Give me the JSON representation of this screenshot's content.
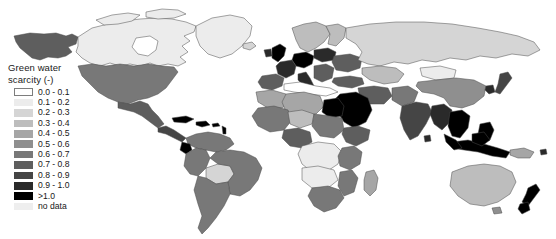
{
  "figure": {
    "type": "choropleth-world-map",
    "background": "#ffffff",
    "ocean_color": "#ffffff",
    "border_color": "#4a4a4a"
  },
  "legend": {
    "title_line1": "Green water",
    "title_line2": "scarcity (-)",
    "entries": [
      {
        "label": "0.0 - 0.1",
        "color": "#ffffff"
      },
      {
        "label": "0.1 - 0.2",
        "color": "#ececec"
      },
      {
        "label": "0.2 - 0.3",
        "color": "#d5d5d5"
      },
      {
        "label": "0.3 - 0.4",
        "color": "#bdbdbd"
      },
      {
        "label": "0.4 - 0.5",
        "color": "#a6a6a6"
      },
      {
        "label": "0.5 - 0.6",
        "color": "#8f8f8f"
      },
      {
        "label": "0.6 - 0.7",
        "color": "#787878"
      },
      {
        "label": "0.7 - 0.8",
        "color": "#5e5e5e"
      },
      {
        "label": "0.8 - 0.9",
        "color": "#454545"
      },
      {
        "label": "0.9 - 1.0",
        "color": "#2a2a2a"
      },
      {
        "label": ">1.0",
        "color": "#000000"
      },
      {
        "label": "no data",
        "color": "#eeeeee"
      }
    ]
  },
  "chart_data": {
    "type": "heatmap",
    "title": "Green water scarcity (-)",
    "xlabel": "",
    "ylabel": "",
    "colorscale": "grayscale-light-to-dark",
    "bins": [
      "0.0 - 0.1",
      "0.1 - 0.2",
      "0.2 - 0.3",
      "0.3 - 0.4",
      "0.4 - 0.5",
      "0.5 - 0.6",
      "0.6 - 0.7",
      "0.7 - 0.8",
      "0.8 - 0.9",
      "0.9 - 1.0",
      ">1.0",
      "no data"
    ],
    "bin_colors": [
      "#ffffff",
      "#ececec",
      "#d5d5d5",
      "#bdbdbd",
      "#a6a6a6",
      "#8f8f8f",
      "#787878",
      "#5e5e5e",
      "#454545",
      "#2a2a2a",
      "#000000",
      "#eeeeee"
    ],
    "regions": [
      {
        "name": "Alaska",
        "bin": "0.7 - 0.8",
        "color": "#5e5e5e"
      },
      {
        "name": "Canada",
        "bin": "0.1 - 0.2",
        "color": "#ececec"
      },
      {
        "name": "Greenland",
        "bin": "0.1 - 0.2",
        "color": "#ececec"
      },
      {
        "name": "United States",
        "bin": "0.6 - 0.7",
        "color": "#787878"
      },
      {
        "name": "Mexico",
        "bin": "0.7 - 0.8",
        "color": "#5e5e5e"
      },
      {
        "name": "Central America",
        "bin": "0.8 - 0.9",
        "color": "#454545"
      },
      {
        "name": "Caribbean",
        "bin": ">1.0",
        "color": "#000000"
      },
      {
        "name": "Colombia",
        "bin": "0.6 - 0.7",
        "color": "#787878"
      },
      {
        "name": "Ecuador",
        "bin": ">1.0",
        "color": "#000000"
      },
      {
        "name": "Peru",
        "bin": "0.6 - 0.7",
        "color": "#787878"
      },
      {
        "name": "Bolivia",
        "bin": "0.2 - 0.3",
        "color": "#d5d5d5"
      },
      {
        "name": "Brazil",
        "bin": "0.6 - 0.7",
        "color": "#787878"
      },
      {
        "name": "Argentina",
        "bin": "0.6 - 0.7",
        "color": "#787878"
      },
      {
        "name": "Chile",
        "bin": "0.6 - 0.7",
        "color": "#787878"
      },
      {
        "name": "Venezuela",
        "bin": "0.6 - 0.7",
        "color": "#787878"
      },
      {
        "name": "United Kingdom",
        "bin": ">1.0",
        "color": "#000000"
      },
      {
        "name": "Germany",
        "bin": ">1.0",
        "color": "#000000"
      },
      {
        "name": "France",
        "bin": "0.9 - 1.0",
        "color": "#2a2a2a"
      },
      {
        "name": "Spain",
        "bin": "0.7 - 0.8",
        "color": "#5e5e5e"
      },
      {
        "name": "Italy",
        "bin": "0.9 - 1.0",
        "color": "#2a2a2a"
      },
      {
        "name": "Poland",
        "bin": "0.9 - 1.0",
        "color": "#2a2a2a"
      },
      {
        "name": "Scandinavia",
        "bin": "0.3 - 0.4",
        "color": "#bdbdbd"
      },
      {
        "name": "Eastern Europe",
        "bin": "0.7 - 0.8",
        "color": "#5e5e5e"
      },
      {
        "name": "Turkey",
        "bin": "0.7 - 0.8",
        "color": "#5e5e5e"
      },
      {
        "name": "Russia",
        "bin": "0.2 - 0.3",
        "color": "#d5d5d5"
      },
      {
        "name": "Egypt",
        "bin": ">1.0",
        "color": "#000000"
      },
      {
        "name": "Saudi Arabia",
        "bin": ">1.0",
        "color": "#000000"
      },
      {
        "name": "Iran",
        "bin": "0.7 - 0.8",
        "color": "#5e5e5e"
      },
      {
        "name": "North Africa",
        "bin": "0.4 - 0.5",
        "color": "#a6a6a6"
      },
      {
        "name": "Sahel",
        "bin": "0.6 - 0.7",
        "color": "#787878"
      },
      {
        "name": "Nigeria",
        "bin": "0.7 - 0.8",
        "color": "#5e5e5e"
      },
      {
        "name": "Congo Basin",
        "bin": "0.1 - 0.2",
        "color": "#ececec"
      },
      {
        "name": "Ethiopia",
        "bin": "0.7 - 0.8",
        "color": "#5e5e5e"
      },
      {
        "name": "Kenya",
        "bin": "0.6 - 0.7",
        "color": "#787878"
      },
      {
        "name": "Angola",
        "bin": "0.1 - 0.2",
        "color": "#ececec"
      },
      {
        "name": "Zambia",
        "bin": "0.1 - 0.2",
        "color": "#ececec"
      },
      {
        "name": "South Africa",
        "bin": "0.6 - 0.7",
        "color": "#787878"
      },
      {
        "name": "Madagascar",
        "bin": "0.4 - 0.5",
        "color": "#a6a6a6"
      },
      {
        "name": "India",
        "bin": "0.8 - 0.9",
        "color": "#454545"
      },
      {
        "name": "Pakistan",
        "bin": "0.6 - 0.7",
        "color": "#787878"
      },
      {
        "name": "China",
        "bin": "0.5 - 0.6",
        "color": "#8f8f8f"
      },
      {
        "name": "Mongolia",
        "bin": "0.1 - 0.2",
        "color": "#ececec"
      },
      {
        "name": "Kazakhstan",
        "bin": "0.3 - 0.4",
        "color": "#bdbdbd"
      },
      {
        "name": "Japan",
        "bin": "0.8 - 0.9",
        "color": "#454545"
      },
      {
        "name": "Korea",
        "bin": "0.9 - 1.0",
        "color": "#2a2a2a"
      },
      {
        "name": "Thailand",
        "bin": "0.9 - 1.0",
        "color": "#2a2a2a"
      },
      {
        "name": "Vietnam",
        "bin": ">1.0",
        "color": "#000000"
      },
      {
        "name": "Philippines",
        "bin": ">1.0",
        "color": "#000000"
      },
      {
        "name": "Indonesia",
        "bin": ">1.0",
        "color": "#000000"
      },
      {
        "name": "Malaysia",
        "bin": ">1.0",
        "color": "#000000"
      },
      {
        "name": "Papua New Guinea",
        "bin": "0.4 - 0.5",
        "color": "#a6a6a6"
      },
      {
        "name": "Australia",
        "bin": "0.3 - 0.4",
        "color": "#bdbdbd"
      },
      {
        "name": "New Zealand",
        "bin": ">1.0",
        "color": "#000000"
      }
    ]
  }
}
